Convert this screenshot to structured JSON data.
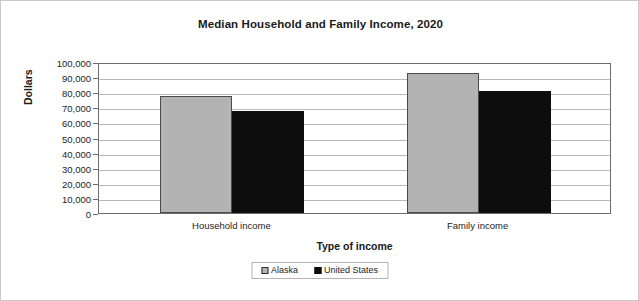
{
  "chart_data": {
    "type": "bar",
    "title": "Median Household and Family Income, 2020",
    "xlabel": "Type of income",
    "ylabel": "Dollars",
    "categories": [
      "Household income",
      "Family income"
    ],
    "series": [
      {
        "name": "Alaska",
        "values": [
          77800,
          93000
        ],
        "color": "#b3b3b3"
      },
      {
        "name": "United States",
        "values": [
          67500,
          80500
        ],
        "color": "#0d0d0d"
      }
    ],
    "ylim": [
      0,
      100000
    ],
    "ytick_step": 10000,
    "ytick_labels": [
      "100,000",
      "90,000",
      "80,000",
      "70,000",
      "60,000",
      "50,000",
      "40,000",
      "30,000",
      "20,000",
      "10,000",
      "0"
    ],
    "grid": true,
    "legend_position": "bottom"
  },
  "legend": {
    "items": [
      {
        "label": "Alaska",
        "swatch": "legend-swatch-gray"
      },
      {
        "label": "United States",
        "swatch": "legend-swatch-black"
      }
    ]
  }
}
